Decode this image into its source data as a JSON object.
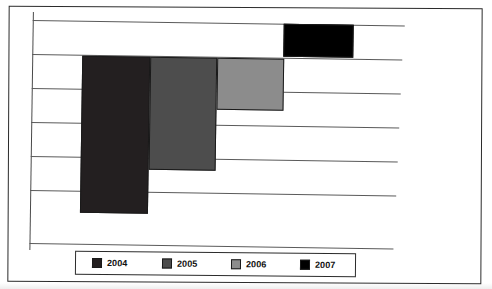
{
  "document": {
    "title_strip_text": "",
    "border_color": "#2b2b2b",
    "background": "#ffffff"
  },
  "chart_data": {
    "type": "bar",
    "title": "",
    "subtitle": "",
    "xlabel": "",
    "ylabel": "",
    "orientation": "inverted-vertical",
    "grid": true,
    "gridline_count": 7,
    "legend_position": "bottom",
    "axis_tick_labels": [],
    "categories": [
      "2004",
      "2005",
      "2006",
      "2007"
    ],
    "values": [
      6.2,
      4.5,
      2.1,
      1.3
    ],
    "ylim": [
      0,
      7
    ],
    "series": [
      {
        "name": "Annual value by year",
        "categories": [
          "2004",
          "2005",
          "2006",
          "2007"
        ],
        "values": [
          6.2,
          4.5,
          2.1,
          1.3
        ]
      }
    ],
    "bars": [
      {
        "label": "2004",
        "value": 6.2,
        "color": "#231f20",
        "x": 81,
        "y": 55,
        "width": 68,
        "height": 157
      },
      {
        "label": "2005",
        "value": 4.5,
        "color": "#4d4d4d",
        "x": 149,
        "y": 55,
        "width": 67,
        "height": 113
      },
      {
        "label": "2006",
        "value": 2.1,
        "color": "#8c8c8c",
        "x": 216,
        "y": 55,
        "width": 67,
        "height": 52
      },
      {
        "label": "2007",
        "value": 1.3,
        "color": "#000000",
        "x": 282,
        "y": 20,
        "width": 70,
        "height": 33
      }
    ],
    "gridlines": [
      {
        "y": 20,
        "width": 372
      },
      {
        "y": 54,
        "width": 370
      },
      {
        "y": 88,
        "width": 369
      },
      {
        "y": 122,
        "width": 368
      },
      {
        "y": 156,
        "width": 367
      },
      {
        "y": 190,
        "width": 366
      },
      {
        "y": 243,
        "width": 364
      }
    ]
  },
  "legend": {
    "items": [
      {
        "label": "2004",
        "color": "#231f20",
        "offset": 16
      },
      {
        "label": "2005",
        "color": "#4d4d4d",
        "offset": 86
      },
      {
        "label": "2006",
        "color": "#8c8c8c",
        "offset": 155
      },
      {
        "label": "2007",
        "color": "#000000",
        "offset": 224
      }
    ]
  }
}
